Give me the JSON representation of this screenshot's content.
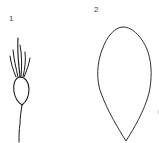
{
  "figures": [
    {
      "label": "1",
      "description": "achene with pappus bristles and slender stalk",
      "icon": "achene-with-pappus-icon"
    },
    {
      "label": "2",
      "description": "obovate teardrop-shaped outline, pointed at base",
      "icon": "teardrop-outline-icon"
    }
  ],
  "colors": {
    "stroke": "#1a1a1a",
    "label": "#444444",
    "background": "#ffffff"
  }
}
